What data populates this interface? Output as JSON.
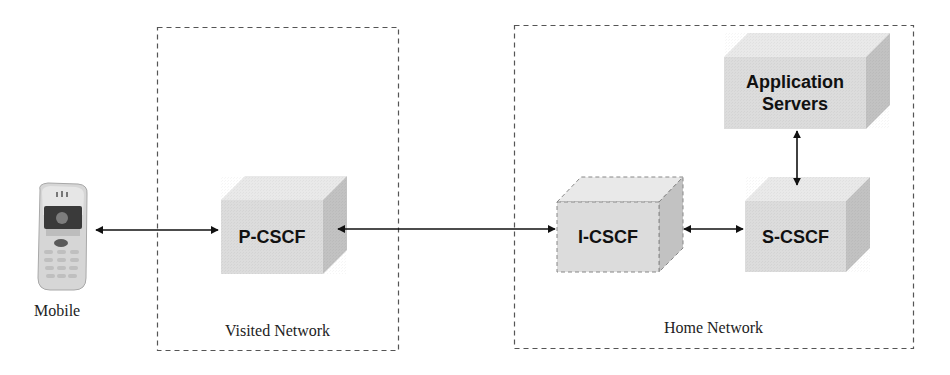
{
  "diagram": {
    "colors": {
      "box_top": "#e9e9e9",
      "box_front": "#dcdcdc",
      "box_side": "#c2c2c2",
      "border_dashed": "#555555",
      "arrow": "#111111",
      "text": "#111111"
    },
    "regions": [
      {
        "id": "visited",
        "label": "Visited Network"
      },
      {
        "id": "home",
        "label": "Home Network"
      }
    ],
    "endpoint": {
      "id": "mobile",
      "label": "Mobile",
      "icon": "mobile-phone-icon"
    },
    "nodes": [
      {
        "id": "p-cscf",
        "label": "P-CSCF",
        "region": "visited",
        "style": "solid"
      },
      {
        "id": "i-cscf",
        "label": "I-CSCF",
        "region": "home",
        "style": "dashed"
      },
      {
        "id": "s-cscf",
        "label": "S-CSCF",
        "region": "home",
        "style": "solid"
      },
      {
        "id": "app-servers",
        "label_line1": "Application",
        "label_line2": "Servers",
        "region": "home",
        "style": "solid"
      }
    ],
    "edges": [
      {
        "from": "mobile",
        "to": "p-cscf",
        "direction": "bidirectional"
      },
      {
        "from": "p-cscf",
        "to": "i-cscf",
        "direction": "bidirectional"
      },
      {
        "from": "i-cscf",
        "to": "s-cscf",
        "direction": "bidirectional"
      },
      {
        "from": "s-cscf",
        "to": "app-servers",
        "direction": "bidirectional"
      }
    ]
  }
}
